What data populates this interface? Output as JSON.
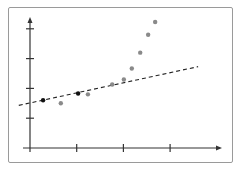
{
  "chart_data": {
    "type": "scatter",
    "title": "",
    "xlabel": "",
    "ylabel": "",
    "x_ticks": [
      1,
      2,
      3
    ],
    "y_ticks": [
      1,
      2,
      3,
      4
    ],
    "tick_labels_shown": false,
    "xlim": [
      0,
      4
    ],
    "ylim": [
      0,
      4.3
    ],
    "grid": false,
    "legend": null,
    "series": [
      {
        "name": "highlighted points",
        "color": "#111111",
        "points": [
          {
            "x": 0.28,
            "y": 1.6
          },
          {
            "x": 1.03,
            "y": 1.83
          }
        ]
      },
      {
        "name": "other points",
        "color": "#8a8a8a",
        "points": [
          {
            "x": 0.66,
            "y": 1.5
          },
          {
            "x": 1.24,
            "y": 1.8
          },
          {
            "x": 1.76,
            "y": 2.13
          },
          {
            "x": 2.01,
            "y": 2.3
          },
          {
            "x": 2.18,
            "y": 2.67
          },
          {
            "x": 2.36,
            "y": 3.2
          },
          {
            "x": 2.53,
            "y": 3.8
          },
          {
            "x": 2.68,
            "y": 4.23
          }
        ]
      }
    ],
    "trend_line": {
      "style": "dashed",
      "color": "#222222",
      "x_start": -0.24,
      "y_start": 1.43,
      "x_end": 3.6,
      "y_end": 2.73
    }
  },
  "colors": {
    "frame": "#9a9a9a",
    "axis": "#333333",
    "background": "#ffffff"
  }
}
